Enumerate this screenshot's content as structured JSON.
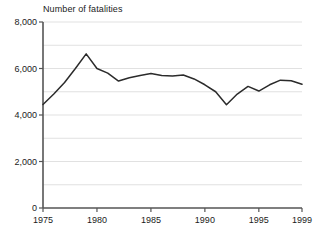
{
  "chart_data": {
    "type": "line",
    "title": "Number of fatalities",
    "xlabel": "",
    "ylabel": "",
    "xlim": [
      1975,
      1999
    ],
    "ylim": [
      0,
      8000
    ],
    "grid": true,
    "grid_interval": 1000,
    "legend": "none",
    "line_color": "#2b2b2b",
    "grid_color": "#d9d9d9",
    "axis_color": "#555555",
    "background_color": "#ffffff",
    "y_ticks": [
      {
        "value": 0,
        "label": "0"
      },
      {
        "value": 2000,
        "label": "2,000"
      },
      {
        "value": 4000,
        "label": "4,000"
      },
      {
        "value": 6000,
        "label": "6,000"
      },
      {
        "value": 8000,
        "label": "8,000"
      }
    ],
    "x_ticks": [
      {
        "value": 1975,
        "label": "1975"
      },
      {
        "value": 1980,
        "label": "1980"
      },
      {
        "value": 1985,
        "label": "1985"
      },
      {
        "value": 1990,
        "label": "1990"
      },
      {
        "value": 1995,
        "label": "1995"
      },
      {
        "value": 1999,
        "label": "1999"
      }
    ],
    "x": [
      1975,
      1976,
      1977,
      1978,
      1979,
      1980,
      1981,
      1982,
      1983,
      1984,
      1985,
      1986,
      1987,
      1988,
      1989,
      1990,
      1991,
      1992,
      1993,
      1994,
      1995,
      1996,
      1997,
      1998,
      1999
    ],
    "values": [
      4450,
      4900,
      5400,
      6000,
      6630,
      6000,
      5800,
      5460,
      5600,
      5700,
      5780,
      5700,
      5680,
      5720,
      5550,
      5300,
      5000,
      4440,
      4900,
      5230,
      5030,
      5300,
      5500,
      5470,
      5320
    ],
    "series": [
      {
        "name": "Number of fatalities",
        "values": [
          4450,
          4900,
          5400,
          6000,
          6630,
          6000,
          5800,
          5460,
          5600,
          5700,
          5780,
          5700,
          5680,
          5720,
          5550,
          5300,
          5000,
          4440,
          4900,
          5230,
          5030,
          5300,
          5500,
          5470,
          5320
        ]
      }
    ]
  },
  "axis": {
    "y_labels": [
      "8,000",
      "6,000",
      "4,000",
      "2,000",
      "0"
    ],
    "x_labels": [
      "1975",
      "1980",
      "1985",
      "1990",
      "1995",
      "1999"
    ]
  }
}
